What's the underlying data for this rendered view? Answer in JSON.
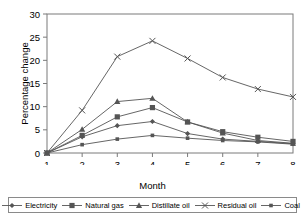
{
  "chart_data": {
    "type": "line",
    "title": "",
    "xlabel": "Month",
    "ylabel": "Percentage change",
    "x": [
      1,
      2,
      3,
      4,
      5,
      6,
      7,
      8
    ],
    "xtick_labels": [
      "1",
      "2",
      "3",
      "4",
      "5",
      "6",
      "7",
      "8"
    ],
    "ytick_labels": [
      "0",
      "5",
      "10",
      "15",
      "20",
      "25",
      "30"
    ],
    "yticks": [
      0,
      5,
      10,
      15,
      20,
      25,
      30
    ],
    "xlim": [
      1,
      8
    ],
    "ylim": [
      0,
      30
    ],
    "grid": false,
    "legend_position": "bottom",
    "series": [
      {
        "name": "Electricity",
        "marker": "small-diamond",
        "values": [
          0.0,
          3.5,
          5.9,
          6.8,
          4.2,
          3.0,
          2.5,
          2.0
        ]
      },
      {
        "name": "Natural gas",
        "marker": "square",
        "values": [
          0.0,
          3.8,
          7.8,
          9.8,
          6.7,
          4.6,
          3.4,
          2.5
        ]
      },
      {
        "name": "Distillate oil",
        "marker": "triangle",
        "values": [
          0.0,
          5.1,
          11.1,
          11.8,
          6.7,
          4.3,
          2.7,
          2.1
        ]
      },
      {
        "name": "Residual oil",
        "marker": "cross",
        "values": [
          0.0,
          9.2,
          20.8,
          24.2,
          20.4,
          16.3,
          13.8,
          12.1
        ]
      },
      {
        "name": "Coal",
        "marker": "small-square",
        "values": [
          0.0,
          1.8,
          3.0,
          3.8,
          3.2,
          2.7,
          2.4,
          1.9
        ]
      }
    ]
  },
  "legend": {
    "entries": [
      "Electricity",
      "Natural gas",
      "Distillate oil",
      "Residual oil",
      "Coal"
    ]
  },
  "colors": {
    "line": "#555555",
    "axis": "#7a7a7a",
    "text": "#000000",
    "background": "#ffffff"
  }
}
